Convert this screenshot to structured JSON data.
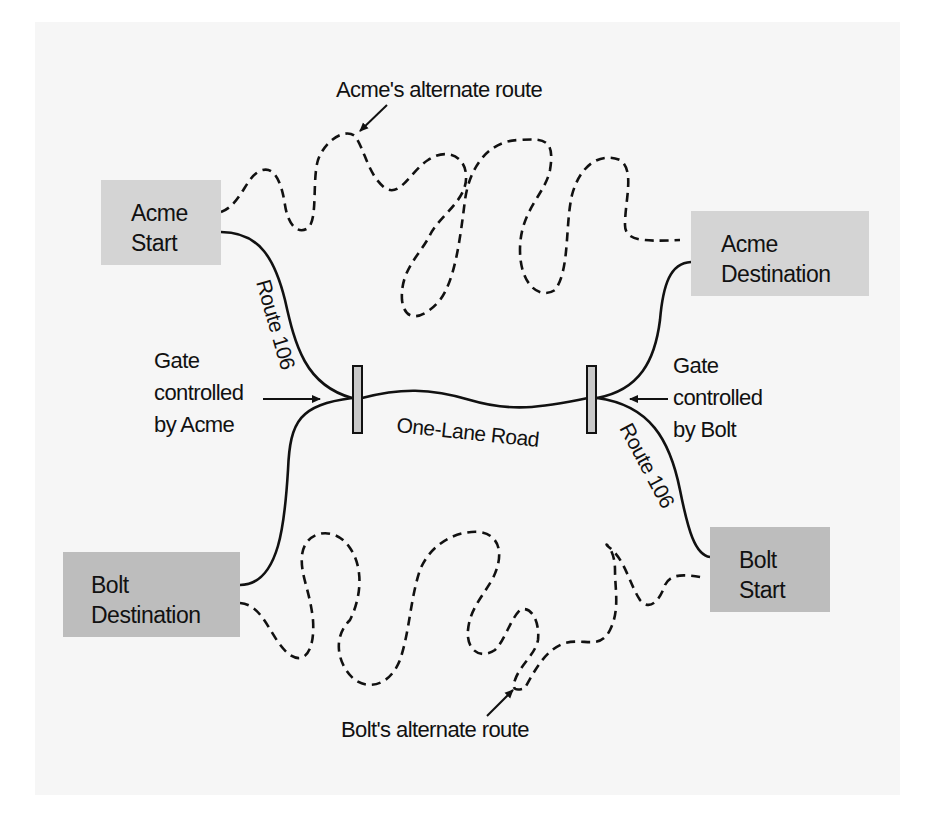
{
  "diagram": {
    "title": "",
    "nodes": {
      "acme_start": {
        "line1": "Acme",
        "line2": "Start"
      },
      "acme_destination": {
        "line1": "Acme",
        "line2": "Destination"
      },
      "bolt_destination": {
        "line1": "Bolt",
        "line2": "Destination"
      },
      "bolt_start": {
        "line1": "Bolt",
        "line2": "Start"
      }
    },
    "labels": {
      "acme_alternate_route": "Acme's alternate route",
      "bolt_alternate_route": "Bolt's alternate route",
      "route_106_left": "Route 106",
      "route_106_right": "Route 106",
      "one_lane_road": "One-Lane Road",
      "gate_acme": {
        "line1": "Gate",
        "line2": "controlled",
        "line3": "by Acme"
      },
      "gate_bolt": {
        "line1": "Gate",
        "line2": "controlled",
        "line3": "by Bolt"
      }
    },
    "edges": [
      {
        "from": "Acme Start",
        "to": "Acme Destination",
        "via": "Route 106 → One-Lane Road → Route 106",
        "style": "solid"
      },
      {
        "from": "Bolt Start",
        "to": "Bolt Destination",
        "via": "Route 106 → One-Lane Road → Route 106",
        "style": "solid"
      },
      {
        "from": "Acme Start",
        "to": "Acme Destination",
        "via": "Acme's alternate route",
        "style": "dashed"
      },
      {
        "from": "Bolt Start",
        "to": "Bolt Destination",
        "via": "Bolt's alternate route",
        "style": "dashed"
      }
    ],
    "gates": [
      {
        "position": "left end of One-Lane Road",
        "controlled_by": "Acme"
      },
      {
        "position": "right end of One-Lane Road",
        "controlled_by": "Bolt"
      }
    ],
    "colors": {
      "panel_background": "#f6f6f6",
      "acme_box": "#d4d4d4",
      "bolt_box": "#bdbdbd",
      "gate_fill": "#c8c8c8",
      "line": "#111111"
    }
  }
}
